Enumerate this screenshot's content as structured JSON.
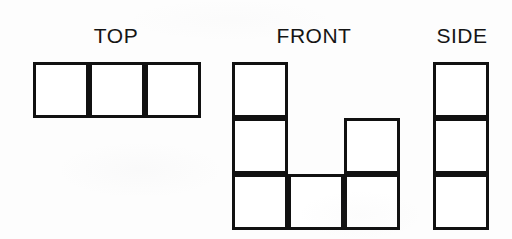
{
  "figure": {
    "background_color": "#fdfdfd",
    "stroke_color": "#111111",
    "fill_color": "#ffffff",
    "stroke_width_px": 3,
    "cell_size_px": 56
  },
  "views": [
    {
      "id": "top",
      "label": "TOP",
      "label_left_px": 82,
      "label_top_px": 25,
      "label_width_px": 68,
      "origin_x_px": 33,
      "origin_y_px": 62,
      "columns": 3,
      "rows": 1,
      "filled_cells": [
        {
          "col": 0,
          "row": 0
        },
        {
          "col": 1,
          "row": 0
        },
        {
          "col": 2,
          "row": 0
        }
      ]
    },
    {
      "id": "front",
      "label": "FRONT",
      "label_left_px": 272,
      "label_top_px": 25,
      "label_width_px": 84,
      "origin_x_px": 232,
      "origin_y_px": 62,
      "columns": 3,
      "rows": 3,
      "filled_cells": [
        {
          "col": 0,
          "row": 0
        },
        {
          "col": 0,
          "row": 1
        },
        {
          "col": 0,
          "row": 2
        },
        {
          "col": 1,
          "row": 2
        },
        {
          "col": 2,
          "row": 1
        },
        {
          "col": 2,
          "row": 2
        }
      ]
    },
    {
      "id": "side",
      "label": "SIDE",
      "label_left_px": 430,
      "label_top_px": 25,
      "label_width_px": 64,
      "origin_x_px": 433,
      "origin_y_px": 62,
      "columns": 1,
      "rows": 3,
      "filled_cells": [
        {
          "col": 0,
          "row": 0
        },
        {
          "col": 0,
          "row": 1
        },
        {
          "col": 0,
          "row": 2
        }
      ]
    }
  ]
}
